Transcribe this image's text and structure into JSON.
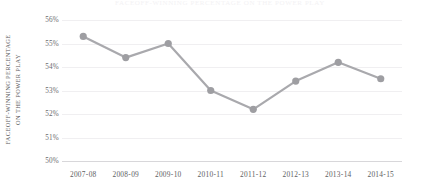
{
  "chart_data": {
    "type": "line",
    "title": "FACEOFF-WINNING PERCENTAGE ON THE POWER PLAY",
    "subtitle": "",
    "xlabel": "",
    "ylabel_line1": "FACEOFF-WINNING PERCENTAGE",
    "ylabel_line2": "ON THE POWER PLAY",
    "categories": [
      "2007-08",
      "2008-09",
      "2009-10",
      "2010-11",
      "2011-12",
      "2012-13",
      "2013-14",
      "2014-15"
    ],
    "values": [
      55.3,
      54.4,
      55.0,
      53.0,
      52.2,
      53.4,
      54.2,
      53.5
    ],
    "value_suffix": "%",
    "ylim": [
      50,
      56
    ],
    "y_ticks": [
      "50%",
      "51%",
      "52%",
      "53%",
      "54%",
      "55%",
      "56%"
    ],
    "y_tick_values": [
      50,
      51,
      52,
      53,
      54,
      55,
      56
    ],
    "grid": true,
    "legend": "none",
    "series_color": "#a9a9ad",
    "marker_color": "#9e9ea2",
    "grid_color": "#f0eff1",
    "axis_color": "#d8d7da",
    "text_color": "#5e5e62"
  }
}
